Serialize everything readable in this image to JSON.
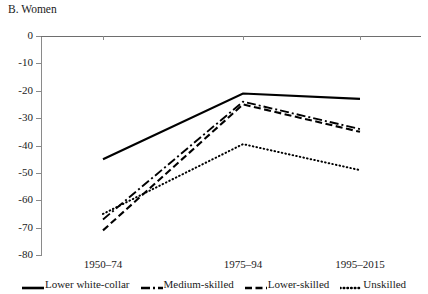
{
  "panel": {
    "title": "B. Women"
  },
  "chart_data": {
    "type": "line",
    "title": "B. Women",
    "xlabel": "",
    "ylabel": "",
    "categories": [
      "1950–74",
      "1975–94",
      "1995–2015"
    ],
    "ylim": [
      -80,
      0
    ],
    "ytick_labels": [
      "0",
      "-10",
      "-20",
      "-30",
      "-40",
      "-50",
      "-60",
      "-70",
      "-80"
    ],
    "ytick_values": [
      0,
      -10,
      -20,
      -30,
      -40,
      -50,
      -60,
      -70,
      -80
    ],
    "grid": false,
    "legend_position": "bottom",
    "series": [
      {
        "name": "Lower white-collar",
        "style": "solid",
        "color": "#000000",
        "values": [
          -45,
          -21,
          -23
        ]
      },
      {
        "name": "Medium-skilled",
        "style": "dash-dot",
        "color": "#000000",
        "values": [
          -67,
          -24,
          -34
        ]
      },
      {
        "name": "Lower-skilled",
        "style": "dashed",
        "color": "#000000",
        "values": [
          -71,
          -25,
          -35
        ]
      },
      {
        "name": "Unskilled",
        "style": "dotted",
        "color": "#000000",
        "values": [
          -65,
          -39.5,
          -49
        ]
      }
    ]
  }
}
